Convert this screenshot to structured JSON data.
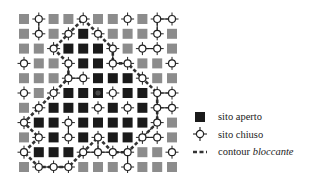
{
  "diagram": {
    "grid_size": 11,
    "origin": [
      19,
      14
    ],
    "pitch": 14.8,
    "cell": 10,
    "colors": {
      "open": "#1a1a1a",
      "blocked": "#8c8c8c",
      "open_center": "#4a4a4a",
      "closed_stroke": "#222222",
      "contour": "#333333"
    },
    "legend_note": "G = sito (grigio), B = sito aperto, C = sito chiuso",
    "rows": [
      "GCGGCGGCGCC",
      "GCGCBCGGGCG",
      "GGCBBBCGCCG",
      "CGGCBBCCGGC",
      "GGGCCBBBCGG",
      "CGCBBXCBBCC",
      "GCBBBCBCBCC",
      "CBBCBBBBBCG",
      "GCBCBCBBCCG",
      "CBBBCCCCGGC",
      "GCCCGGGCGGG"
    ],
    "bonds": [
      [
        [
          1,
          0
        ],
        [
          1,
          1
        ]
      ],
      [
        [
          9,
          0
        ],
        [
          10,
          0
        ]
      ],
      [
        [
          9,
          0
        ],
        [
          9,
          1
        ]
      ],
      [
        [
          8,
          2
        ],
        [
          9,
          2
        ]
      ],
      [
        [
          6,
          2
        ],
        [
          6,
          3
        ]
      ],
      [
        [
          6,
          3
        ],
        [
          7,
          3
        ]
      ],
      [
        [
          3,
          3
        ],
        [
          3,
          4
        ]
      ],
      [
        [
          3,
          4
        ],
        [
          4,
          4
        ]
      ],
      [
        [
          9,
          5
        ],
        [
          10,
          5
        ]
      ],
      [
        [
          9,
          5
        ],
        [
          9,
          6
        ]
      ],
      [
        [
          9,
          6
        ],
        [
          10,
          6
        ]
      ],
      [
        [
          9,
          6
        ],
        [
          9,
          7
        ]
      ],
      [
        [
          9,
          7
        ],
        [
          8,
          8
        ]
      ],
      [
        [
          8,
          8
        ],
        [
          9,
          8
        ]
      ],
      [
        [
          3,
          7
        ],
        [
          3,
          8
        ]
      ],
      [
        [
          5,
          8
        ],
        [
          5,
          9
        ]
      ],
      [
        [
          4,
          9
        ],
        [
          5,
          9
        ]
      ],
      [
        [
          5,
          9
        ],
        [
          6,
          9
        ]
      ],
      [
        [
          6,
          9
        ],
        [
          7,
          9
        ]
      ],
      [
        [
          7,
          9
        ],
        [
          7,
          10
        ]
      ],
      [
        [
          1,
          10
        ],
        [
          2,
          10
        ]
      ],
      [
        [
          2,
          10
        ],
        [
          3,
          10
        ]
      ],
      [
        [
          0,
          7
        ],
        [
          0,
          7
        ]
      ]
    ],
    "contour": [
      [
        4,
        0
      ],
      [
        5,
        1
      ],
      [
        6,
        2
      ],
      [
        6,
        3
      ],
      [
        7,
        3
      ],
      [
        8,
        4
      ],
      [
        9,
        5
      ],
      [
        9,
        6
      ],
      [
        9,
        7
      ],
      [
        8,
        8
      ],
      [
        7,
        9
      ],
      [
        6,
        9
      ],
      [
        5,
        8
      ],
      [
        4,
        9
      ],
      [
        3,
        10
      ],
      [
        2,
        10
      ],
      [
        1,
        10
      ],
      [
        0,
        9
      ],
      [
        1,
        8
      ],
      [
        0,
        7
      ],
      [
        1,
        6
      ],
      [
        2,
        5
      ],
      [
        3,
        4
      ],
      [
        3,
        3
      ],
      [
        2,
        2
      ],
      [
        3,
        1
      ],
      [
        4,
        0
      ]
    ]
  },
  "legend": {
    "items": [
      {
        "symbol": "open-square",
        "label": "sito aperto"
      },
      {
        "symbol": "closed-circle",
        "label": "sito chiuso"
      },
      {
        "symbol": "dashed-line",
        "label_plain": "contour ",
        "label_italic": "bloccante"
      }
    ]
  }
}
